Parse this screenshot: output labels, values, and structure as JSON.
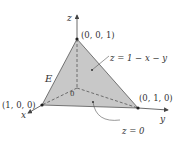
{
  "figure": {
    "region_label": "E",
    "axes": {
      "x": "x",
      "y": "y",
      "z": "z",
      "origin": "0"
    },
    "points": {
      "top": "(0, 0, 1)",
      "left": "(1, 0, 0)",
      "right": "(0, 1, 0)"
    },
    "annotations": {
      "top_surface": "z = 1 − x − y",
      "bottom_surface": "z = 0"
    },
    "colors": {
      "face_fill": "#c8c8c8",
      "edge": "#555555",
      "axis": "#444444",
      "point": "#222222"
    }
  }
}
